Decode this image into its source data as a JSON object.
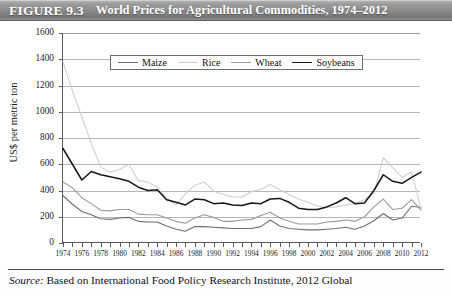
{
  "figure": {
    "label": "FIGURE 9.3",
    "title": "World Prices for Agricultural Commodities, 1974–2012",
    "source_prefix": "Source:",
    "source_text": "Based on International Food Policy Research Institute, 2012 Global"
  },
  "colors": {
    "maize": "#6f6f6f",
    "rice": "#cfcfcf",
    "wheat": "#9a9a9a",
    "soybeans": "#171717",
    "axis": "#5a5a5a",
    "grid": "#b6b6b6",
    "title_band": "#8a8a8a"
  },
  "chart_data": {
    "type": "line",
    "title": "World Prices for Agricultural Commodities, 1974–2012",
    "xlabel": "",
    "ylabel": "US$ per metric ton",
    "ylim": [
      0,
      1600
    ],
    "ytick_step": 200,
    "yticks": [
      0,
      200,
      400,
      600,
      800,
      1000,
      1200,
      1400,
      1600
    ],
    "grid": true,
    "legend_position": "top-center",
    "xlim": [
      1974,
      2012
    ],
    "x": [
      1974,
      1975,
      1976,
      1977,
      1978,
      1979,
      1980,
      1981,
      1982,
      1983,
      1984,
      1985,
      1986,
      1987,
      1988,
      1989,
      1990,
      1991,
      1992,
      1993,
      1994,
      1995,
      1996,
      1997,
      1998,
      1999,
      2000,
      2001,
      2002,
      2003,
      2004,
      2005,
      2006,
      2007,
      2008,
      2009,
      2010,
      2011,
      2012
    ],
    "xtick_labels": [
      "1974",
      "1976",
      "1978",
      "1980",
      "1982",
      "1984",
      "1986",
      "1988",
      "1990",
      "1992",
      "1994",
      "1996",
      "1998",
      "2000",
      "2002",
      "2004",
      "2006",
      "2008",
      "2010",
      "2012"
    ],
    "series": [
      {
        "name": "Maize",
        "color": "#6f6f6f",
        "values": [
          360,
          295,
          240,
          215,
          185,
          180,
          190,
          195,
          165,
          160,
          160,
          130,
          105,
          90,
          125,
          125,
          120,
          115,
          110,
          110,
          110,
          125,
          175,
          130,
          110,
          105,
          100,
          100,
          105,
          110,
          120,
          105,
          130,
          170,
          225,
          175,
          190,
          280,
          270
        ]
      },
      {
        "name": "Rice",
        "color": "#cfcfcf",
        "values": [
          1380,
          1160,
          960,
          760,
          580,
          540,
          560,
          600,
          475,
          465,
          425,
          340,
          290,
          375,
          440,
          465,
          395,
          370,
          350,
          350,
          390,
          410,
          445,
          405,
          370,
          335,
          310,
          280,
          270,
          275,
          290,
          300,
          330,
          380,
          650,
          575,
          500,
          545,
          260
        ]
      },
      {
        "name": "Wheat",
        "color": "#9a9a9a",
        "values": [
          465,
          420,
          345,
          300,
          250,
          245,
          255,
          255,
          220,
          215,
          215,
          190,
          165,
          150,
          190,
          215,
          195,
          165,
          165,
          175,
          180,
          210,
          235,
          190,
          165,
          145,
          145,
          145,
          160,
          165,
          175,
          165,
          200,
          275,
          335,
          255,
          265,
          330,
          250
        ]
      },
      {
        "name": "Soybeans",
        "color": "#171717",
        "values": [
          720,
          600,
          480,
          545,
          520,
          505,
          490,
          470,
          425,
          400,
          405,
          330,
          310,
          290,
          335,
          330,
          300,
          305,
          290,
          285,
          305,
          300,
          335,
          340,
          310,
          265,
          255,
          255,
          275,
          305,
          345,
          300,
          305,
          400,
          520,
          470,
          455,
          500,
          540
        ]
      }
    ]
  }
}
